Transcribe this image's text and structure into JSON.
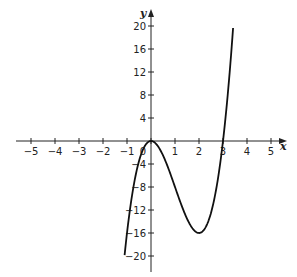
{
  "chart_data": {
    "type": "line",
    "title": "",
    "xlabel": "x",
    "ylabel": "y",
    "xlim": [
      -5,
      5
    ],
    "ylim": [
      -20,
      20
    ],
    "grid": false,
    "x_ticks": [
      -5,
      -4,
      -3,
      -2,
      -1,
      0,
      1,
      2,
      3,
      4,
      5
    ],
    "x_tick_labels": [
      "−5",
      "−4",
      "−3",
      "−2",
      "−1",
      "0",
      "1",
      "2",
      "3",
      "4",
      "5"
    ],
    "y_ticks": [
      -20,
      -16,
      -12,
      -8,
      -4,
      4,
      8,
      12,
      16,
      20
    ],
    "y_tick_labels": [
      "−20",
      "−16",
      "−12",
      "−8",
      "−4",
      "4",
      "8",
      "12",
      "16",
      "20"
    ],
    "series": [
      {
        "name": "f(x) = 4x^3 - 12x^2",
        "x": [
          -1.1,
          -1.0,
          -0.75,
          -0.5,
          -0.25,
          0,
          0.5,
          1,
          1.5,
          2,
          2.5,
          3,
          3.25,
          3.42
        ],
        "y": [
          -19.8,
          -16,
          -8.4,
          -3.5,
          -0.81,
          0,
          -2.5,
          -8,
          -13.5,
          -16,
          -12.5,
          0,
          10.5,
          20
        ]
      }
    ],
    "annotations": [
      "local max at (0, 0)",
      "local min at (2, -16)",
      "x-intercepts at 0 and 3"
    ]
  },
  "colors": {
    "curve": "#111111",
    "axis": "#222222",
    "background": "#ffffff"
  }
}
